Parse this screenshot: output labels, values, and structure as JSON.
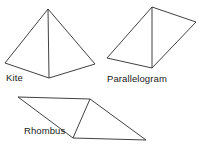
{
  "figure": {
    "background_color": "#ffffff",
    "stroke_color": "#2b2b2b",
    "label_color": "#1a1a1a",
    "width": 200,
    "height": 145,
    "shapes": [
      {
        "id": "kite",
        "label": "Kite",
        "outline_points": "48,9 5,63 49,78 95,64",
        "diagonal_points": "48,9 49,78",
        "label_position": {
          "x": 6,
          "y": 72
        }
      },
      {
        "id": "parallelogram",
        "label": "Parallelogram",
        "outline_points": "152,7 196,22 152,68 107,58",
        "diagonal_points": "152,7 152,68",
        "label_position": {
          "x": 107,
          "y": 73
        }
      },
      {
        "id": "rhombus",
        "label": "Rhombus",
        "outline_points": "18,97 90,99 146,140 73,138",
        "diagonal_points": "90,99 73,138",
        "label_position": {
          "x": 24,
          "y": 125
        }
      }
    ]
  }
}
